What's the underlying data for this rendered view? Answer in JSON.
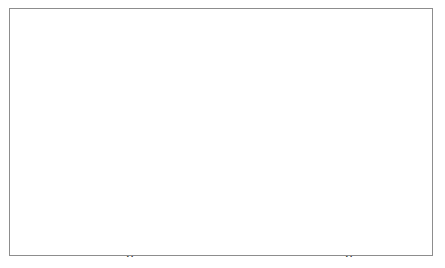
{
  "figure": {
    "background_color": "#ffffff",
    "frame_color": "#8d8d8d",
    "ink_color": "#1a1a1a",
    "panel_count": 2
  },
  "chart_data": [
    {
      "type": "scatter",
      "panel": "left",
      "title": "",
      "xlabel": "x",
      "ylabel": "y",
      "xlim": [
        10,
        185
      ],
      "ylim": [
        54,
        137
      ],
      "xticks": [
        50,
        100,
        150
      ],
      "xtick_labels": [
        "50",
        "100",
        "150"
      ],
      "yticks": [
        60,
        80,
        100,
        120
      ],
      "ytick_labels": [
        "60",
        "80",
        "100",
        "120"
      ],
      "grid": false,
      "legend": null,
      "points": [
        [
          16,
          83.5
        ],
        [
          22,
          77.5
        ],
        [
          38,
          131.5
        ],
        [
          35,
          127.5
        ],
        [
          43,
          127.0
        ],
        [
          45,
          133.0
        ],
        [
          67,
          134.5
        ],
        [
          40,
          123.0
        ],
        [
          38,
          119.0
        ],
        [
          63,
          122.0
        ],
        [
          40,
          112.0
        ],
        [
          44,
          108.5
        ],
        [
          44,
          106.0
        ],
        [
          42,
          105.5
        ],
        [
          40,
          104.5
        ],
        [
          41,
          104.0
        ],
        [
          39,
          103.5
        ],
        [
          42,
          103.0
        ],
        [
          43,
          102.5
        ],
        [
          46,
          105.0
        ],
        [
          48,
          104.5
        ],
        [
          50,
          104.0
        ],
        [
          56,
          104.5
        ],
        [
          60,
          105.0
        ],
        [
          68,
          105.5
        ],
        [
          70,
          104.5
        ],
        [
          47,
          101.0
        ],
        [
          52,
          100.5
        ],
        [
          58,
          100.0
        ],
        [
          62,
          99.0
        ],
        [
          66,
          97.5
        ],
        [
          72,
          95.5
        ],
        [
          44,
          95.0
        ],
        [
          47,
          95.0
        ],
        [
          50,
          95.0
        ],
        [
          53,
          95.0
        ],
        [
          45,
          93.5
        ],
        [
          55,
          93.0
        ],
        [
          58,
          92.5
        ],
        [
          74,
          93.0
        ],
        [
          43,
          87.5
        ],
        [
          48,
          87.0
        ],
        [
          60,
          86.5
        ],
        [
          72,
          87.0
        ],
        [
          45,
          83.0
        ],
        [
          52,
          81.5
        ],
        [
          56,
          81.0
        ],
        [
          59,
          81.0
        ],
        [
          65,
          81.5
        ],
        [
          68,
          79.0
        ],
        [
          76,
          79.5
        ],
        [
          83,
          77.0
        ],
        [
          85,
          76.5
        ],
        [
          47,
          72.5
        ],
        [
          54,
          72.5
        ],
        [
          58,
          72.5
        ],
        [
          70,
          73.0
        ],
        [
          68,
          68.0
        ],
        [
          43,
          58.0
        ],
        [
          52,
          58.0
        ],
        [
          58,
          58.0
        ],
        [
          70,
          58.0
        ],
        [
          78,
          58.0
        ],
        [
          136,
          102.0
        ],
        [
          141,
          114.0
        ],
        [
          145,
          124.5
        ],
        [
          149,
          111.5
        ],
        [
          145,
          82.0
        ],
        [
          182,
          108.0
        ]
      ],
      "solid_curve": [
        [
          16,
          81.0
        ],
        [
          20,
          85.5
        ],
        [
          25,
          91.0
        ],
        [
          30,
          95.5
        ],
        [
          34,
          99.0
        ],
        [
          38,
          102.5
        ],
        [
          41,
          104.0
        ],
        [
          44,
          103.5
        ],
        [
          47,
          102.0
        ],
        [
          50,
          100.5
        ],
        [
          54,
          99.5
        ],
        [
          58,
          98.0
        ],
        [
          62,
          96.0
        ],
        [
          66,
          94.0
        ],
        [
          70,
          92.0
        ],
        [
          74,
          90.5
        ],
        [
          78,
          90.0
        ],
        [
          81,
          88.0
        ],
        [
          84,
          82.5
        ],
        [
          88,
          76.5
        ],
        [
          90,
          75.5
        ],
        [
          100,
          86.5
        ],
        [
          112,
          97.5
        ],
        [
          124,
          105.0
        ],
        [
          132,
          109.0
        ],
        [
          145,
          109.0
        ],
        [
          160,
          108.8
        ],
        [
          172,
          108.5
        ],
        [
          182,
          108.0
        ]
      ],
      "dashed_curve": [
        [
          14,
          92.5
        ],
        [
          20,
          96.0
        ],
        [
          26,
          99.5
        ],
        [
          32,
          102.5
        ],
        [
          38,
          104.8
        ],
        [
          42,
          104.5
        ],
        [
          46,
          102.5
        ],
        [
          50,
          100.0
        ],
        [
          55,
          98.5
        ],
        [
          60,
          96.0
        ],
        [
          65,
          93.0
        ],
        [
          70,
          89.5
        ],
        [
          75,
          86.0
        ],
        [
          80,
          81.5
        ],
        [
          85,
          76.5
        ],
        [
          90,
          72.0
        ],
        [
          100,
          80.5
        ],
        [
          112,
          89.5
        ],
        [
          124,
          97.0
        ],
        [
          136,
          103.5
        ],
        [
          148,
          108.5
        ],
        [
          160,
          110.5
        ],
        [
          172,
          113.0
        ],
        [
          180,
          115.0
        ]
      ],
      "marker": "filled-circle",
      "solid_line_style": "solid",
      "dashed_line_style": "dashed"
    },
    {
      "type": "scatter",
      "panel": "right",
      "title": "",
      "xlabel": "x",
      "ylabel": "y",
      "xlim": [
        -2.15,
        2.2
      ],
      "ylim": [
        -2.25,
        5.0
      ],
      "xticks": [
        -2,
        -1,
        0,
        1,
        2
      ],
      "xtick_labels": [
        "-2",
        "-1",
        "0",
        "1",
        "2"
      ],
      "yticks": [
        -2,
        0,
        2,
        4
      ],
      "ytick_labels": [
        "-2",
        "0",
        "2",
        "4"
      ],
      "grid": false,
      "legend": null,
      "points": [
        [
          -1.9,
          4.7
        ],
        [
          -1.88,
          3.4
        ],
        [
          -1.05,
          2.1
        ],
        [
          -0.88,
          2.05
        ],
        [
          -1.22,
          1.3
        ],
        [
          -0.68,
          1.12
        ],
        [
          -0.58,
          1.1
        ],
        [
          0.22,
          1.75
        ],
        [
          1.02,
          1.75
        ],
        [
          1.12,
          1.5
        ],
        [
          1.28,
          1.82
        ],
        [
          1.78,
          2.15
        ],
        [
          2.08,
          2.75
        ],
        [
          1.22,
          1.08
        ],
        [
          1.35,
          0.95
        ],
        [
          -1.18,
          0.25
        ],
        [
          -0.95,
          0.3
        ],
        [
          -0.88,
          0.32
        ],
        [
          -0.75,
          0.28
        ],
        [
          -0.35,
          0.3
        ],
        [
          -0.18,
          0.42
        ],
        [
          0.12,
          0.28
        ],
        [
          0.28,
          0.45
        ],
        [
          0.42,
          0.52
        ],
        [
          0.52,
          0.3
        ],
        [
          0.88,
          0.5
        ],
        [
          0.08,
          -0.18
        ],
        [
          0.22,
          -0.62
        ],
        [
          0.35,
          -0.88
        ],
        [
          0.45,
          -0.85
        ],
        [
          -0.52,
          -0.62
        ],
        [
          -0.62,
          -0.85
        ],
        [
          -0.88,
          -0.85
        ],
        [
          0.95,
          -0.75
        ],
        [
          1.05,
          -1.0
        ],
        [
          0.75,
          -0.88
        ],
        [
          0.05,
          -1.35
        ],
        [
          0.12,
          -1.9
        ]
      ],
      "solid_curve": [
        [
          -2.1,
          2.45
        ],
        [
          -1.85,
          2.05
        ],
        [
          -1.6,
          1.62
        ],
        [
          -1.4,
          1.25
        ],
        [
          -1.3,
          0.92
        ],
        [
          -1.22,
          0.58
        ],
        [
          -1.15,
          0.3
        ],
        [
          -1.05,
          0.28
        ],
        [
          -0.95,
          0.3
        ],
        [
          -0.85,
          0.28
        ],
        [
          -0.72,
          0.25
        ],
        [
          -0.6,
          0.22
        ],
        [
          -0.48,
          0.2
        ],
        [
          -0.35,
          0.18
        ],
        [
          -0.22,
          0.12
        ],
        [
          -0.12,
          0.05
        ],
        [
          -0.02,
          0.0
        ],
        [
          0.06,
          0.08
        ],
        [
          0.12,
          -0.02
        ],
        [
          0.2,
          0.05
        ],
        [
          0.3,
          0.12
        ],
        [
          0.42,
          0.18
        ],
        [
          0.55,
          0.2
        ],
        [
          0.68,
          0.22
        ],
        [
          0.8,
          0.25
        ],
        [
          0.9,
          0.48
        ],
        [
          1.0,
          0.62
        ],
        [
          1.1,
          0.72
        ],
        [
          1.2,
          0.85
        ],
        [
          1.3,
          0.92
        ],
        [
          1.4,
          0.98
        ],
        [
          1.5,
          1.25
        ],
        [
          1.62,
          1.4
        ],
        [
          1.75,
          1.55
        ],
        [
          1.88,
          1.68
        ],
        [
          2.0,
          1.8
        ],
        [
          2.12,
          1.92
        ]
      ],
      "marker": "filled-circle",
      "solid_line_style": "solid"
    }
  ]
}
